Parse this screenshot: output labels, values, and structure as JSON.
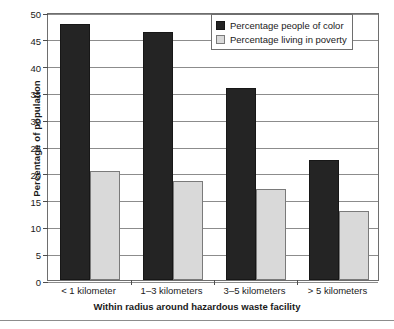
{
  "chart_data": {
    "type": "bar",
    "title": "",
    "xlabel": "Within radius around hazardous waste facility",
    "ylabel": "Percentage of population",
    "categories": [
      "< 1 kilometer",
      "1–3 kilometers",
      "3–5 kilometers",
      "> 5 kilometers"
    ],
    "series": [
      {
        "name": "Percentage people of color",
        "color": "#242424",
        "values": [
          47.7,
          46.2,
          35.8,
          22.4
        ]
      },
      {
        "name": "Percentage living in poverty",
        "color": "#d9d9d9",
        "values": [
          20.3,
          18.5,
          17.0,
          12.9
        ]
      }
    ],
    "ylim": [
      0,
      50
    ],
    "ytick_labels": [
      "0",
      "5",
      "10",
      "15",
      "20",
      "25",
      "30",
      "35",
      "40",
      "45",
      "50"
    ],
    "ytick_values": [
      0,
      5,
      10,
      15,
      20,
      25,
      30,
      35,
      40,
      45,
      50
    ],
    "grid": "horizontal",
    "legend_position": "top-right"
  }
}
